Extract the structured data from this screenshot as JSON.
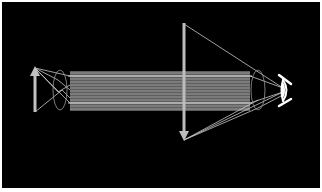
{
  "diagram": {
    "title": "",
    "type": "optical ray diagram (compound telescope / microscope)",
    "background": "#000000",
    "border_color": "#ffffff",
    "line_color": "#bdbdbd",
    "bundle_color": "#8a8a8a",
    "elements": [
      {
        "id": "object-arrow",
        "label": "",
        "x": 35,
        "y_top": 67,
        "y_bottom": 112,
        "direction": "up"
      },
      {
        "id": "objective-lens",
        "label": "",
        "cx": 60,
        "cy": 90,
        "rx": 7,
        "ry": 20
      },
      {
        "id": "parallel-beam",
        "label": "",
        "x1": 70,
        "x2": 250,
        "y_top": 71,
        "y_bottom": 111,
        "line_count": 14
      },
      {
        "id": "image-arrow",
        "label": "",
        "x": 184,
        "y_top": 23,
        "y_bottom": 140,
        "direction": "down"
      },
      {
        "id": "eyepiece-lens",
        "label": "",
        "cx": 258,
        "cy": 90,
        "rx": 7,
        "ry": 20
      },
      {
        "id": "eye",
        "label": "",
        "x": 283,
        "y": 90
      }
    ]
  }
}
